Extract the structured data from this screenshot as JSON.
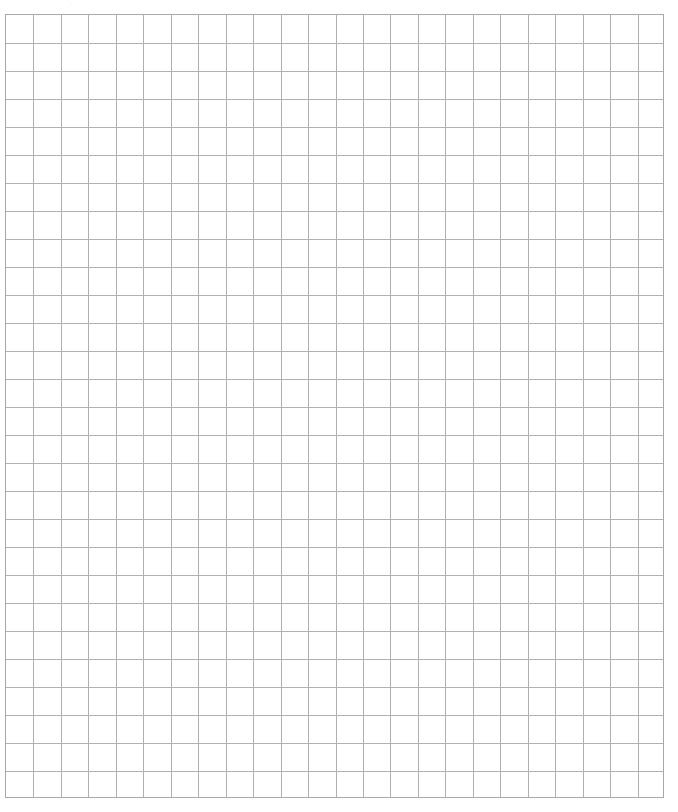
{
  "page": {
    "type": "graph-paper",
    "top_mark": "·",
    "grid": {
      "columns": 24,
      "rows": 28,
      "line_color": "#b0b0b0",
      "background": "#ffffff"
    }
  }
}
